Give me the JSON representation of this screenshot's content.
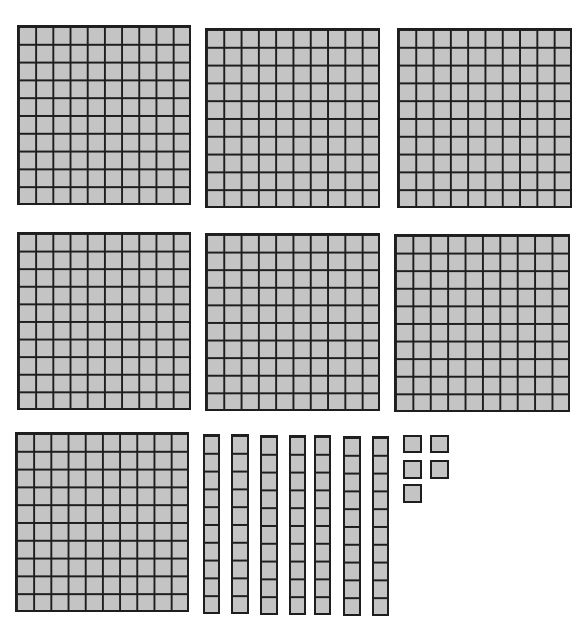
{
  "diagram": {
    "description": "Base-ten blocks representing a number",
    "colors": {
      "fill": "#c4c4c4",
      "stroke": "#1e1e1e",
      "background": "#ffffff"
    },
    "counts": {
      "hundreds": 7,
      "tens": 7,
      "ones": 5
    },
    "value": 775,
    "hundreds_flats": [
      {
        "x": 17,
        "y": 25,
        "w": 174,
        "h": 180
      },
      {
        "x": 205,
        "y": 28,
        "w": 175,
        "h": 180
      },
      {
        "x": 397,
        "y": 28,
        "w": 175,
        "h": 180
      },
      {
        "x": 17,
        "y": 232,
        "w": 174,
        "h": 178
      },
      {
        "x": 205,
        "y": 233,
        "w": 175,
        "h": 178
      },
      {
        "x": 394,
        "y": 234,
        "w": 176,
        "h": 178
      },
      {
        "x": 15,
        "y": 432,
        "w": 174,
        "h": 180
      }
    ],
    "tens_rods": [
      {
        "x": 203,
        "y": 434,
        "w": 17,
        "h": 180
      },
      {
        "x": 231,
        "y": 434,
        "w": 18,
        "h": 180
      },
      {
        "x": 260,
        "y": 435,
        "w": 18,
        "h": 180
      },
      {
        "x": 289,
        "y": 435,
        "w": 17,
        "h": 180
      },
      {
        "x": 314,
        "y": 435,
        "w": 17,
        "h": 180
      },
      {
        "x": 343,
        "y": 436,
        "w": 18,
        "h": 180
      },
      {
        "x": 372,
        "y": 436,
        "w": 17,
        "h": 180
      }
    ],
    "ones_units": [
      {
        "x": 403,
        "y": 435,
        "w": 19,
        "h": 18
      },
      {
        "x": 430,
        "y": 435,
        "w": 19,
        "h": 18
      },
      {
        "x": 403,
        "y": 460,
        "w": 19,
        "h": 19
      },
      {
        "x": 430,
        "y": 460,
        "w": 19,
        "h": 19
      },
      {
        "x": 403,
        "y": 484,
        "w": 19,
        "h": 19
      }
    ]
  }
}
